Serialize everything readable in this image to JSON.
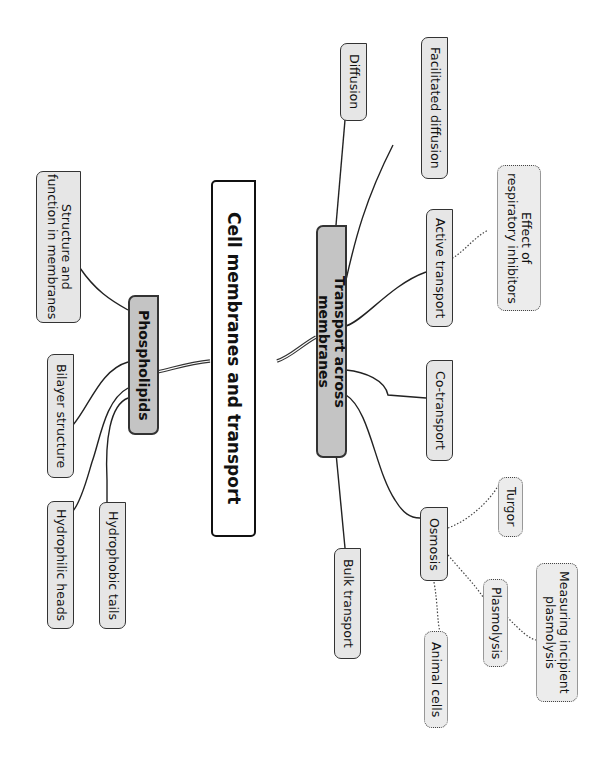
{
  "diagram": {
    "type": "mind-map",
    "orientation": "rotated-90-clockwise",
    "colors": {
      "root_fill": "#ffffff",
      "main_fill": "#c4c4c4",
      "sub_fill": "#e6e6e6",
      "outline": "#333333"
    },
    "root": {
      "label": "Cell membranes and transport"
    },
    "branches": {
      "phospholipids": {
        "label": "Phospholipids",
        "children": {
          "structure": "Structure and\nfunction in membranes",
          "bilayer": "Bilayer structure",
          "hydrophilic": "Hydrophilic heads",
          "hydrophobic": "Hydrophobic tails"
        }
      },
      "transport": {
        "label": "Transport across membranes",
        "children": {
          "diffusion": "Diffusion",
          "facilitated": "Facilitated diffusion",
          "active": "Active transport",
          "cotransport": "Co-transport",
          "osmosis": "Osmosis",
          "bulk": "Bulk transport"
        },
        "active_extras": {
          "inhibitors": "Effect of\nrespiratory inhibitors"
        },
        "osmosis_extras": {
          "turgor": "Turgor",
          "plasmolysis": "Plasmolysis",
          "incipient": "Measuring incipient\nplasmolysis",
          "animal": "Animal cells"
        }
      }
    }
  }
}
